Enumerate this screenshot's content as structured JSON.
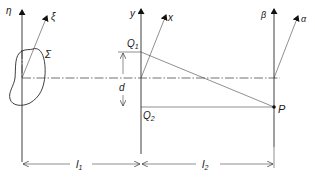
{
  "diagram": {
    "type": "optical-propagation-geometry",
    "planes": [
      {
        "id": "source",
        "axes": {
          "vertical": "η",
          "oblique": "ξ"
        },
        "aperture_label": "Σ"
      },
      {
        "id": "middle",
        "axes": {
          "vertical": "y",
          "oblique": "x"
        }
      },
      {
        "id": "observation",
        "axes": {
          "vertical": "β",
          "oblique": "α"
        }
      }
    ],
    "points": {
      "q1": "Q",
      "q1_sub": "1",
      "q2": "Q",
      "q2_sub": "2",
      "p": "P"
    },
    "dimensions": {
      "d": "d",
      "l1": "l",
      "l1_sub": "1",
      "l2": "l",
      "l2_sub": "2"
    },
    "colors": {
      "ink": "#1a1a1a",
      "background": "#ffffff"
    }
  }
}
